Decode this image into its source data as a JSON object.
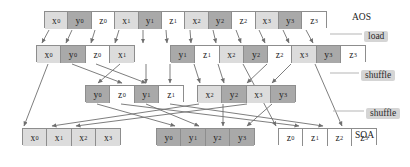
{
  "diagram": {
    "title_left": "AOS",
    "title_bottom": "SOA",
    "rows": [
      {
        "name": "aos-row",
        "y": 11,
        "x": 44,
        "cell_w": 23.4,
        "cell_h": 17,
        "groups": [
          {
            "x": 0,
            "cells": [
              {
                "label": "x",
                "sub": "0",
                "kind": "x"
              },
              {
                "label": "y",
                "sub": "0",
                "kind": "y"
              },
              {
                "label": "z",
                "sub": "0",
                "kind": "z"
              },
              {
                "label": "x",
                "sub": "1",
                "kind": "x"
              },
              {
                "label": "y",
                "sub": "1",
                "kind": "y"
              },
              {
                "label": "z",
                "sub": "1",
                "kind": "z"
              },
              {
                "label": "x",
                "sub": "2",
                "kind": "x"
              },
              {
                "label": "y",
                "sub": "2",
                "kind": "y"
              },
              {
                "label": "z",
                "sub": "2",
                "kind": "z"
              },
              {
                "label": "x",
                "sub": "3",
                "kind": "x"
              },
              {
                "label": "y",
                "sub": "3",
                "kind": "y"
              },
              {
                "label": "z",
                "sub": "3",
                "kind": "z"
              }
            ]
          }
        ]
      },
      {
        "name": "register-row-1",
        "y": 45,
        "x": 36,
        "cell_w": 24.3,
        "cell_h": 17,
        "groups": [
          {
            "x": 0,
            "cells": [
              {
                "label": "x",
                "sub": "0",
                "kind": "x"
              },
              {
                "label": "y",
                "sub": "0",
                "kind": "y"
              },
              {
                "label": "z",
                "sub": "0",
                "kind": "z"
              },
              {
                "label": "x",
                "sub": "1",
                "kind": "x"
              }
            ]
          },
          {
            "x": 134,
            "cells": [
              {
                "label": "y",
                "sub": "1",
                "kind": "y"
              },
              {
                "label": "z",
                "sub": "1",
                "kind": "z"
              },
              {
                "label": "x",
                "sub": "2",
                "kind": "x"
              },
              {
                "label": "y",
                "sub": "2",
                "kind": "y"
              }
            ]
          },
          {
            "x": 231,
            "cells": [
              {
                "label": "z",
                "sub": "2",
                "kind": "z"
              },
              {
                "label": "x",
                "sub": "3",
                "kind": "x"
              },
              {
                "label": "y",
                "sub": "3",
                "kind": "y"
              },
              {
                "label": "z",
                "sub": "3",
                "kind": "z"
              }
            ]
          }
        ]
      },
      {
        "name": "register-row-2",
        "y": 85,
        "x": 85,
        "cell_w": 24.3,
        "cell_h": 17,
        "groups": [
          {
            "x": 0,
            "cells": [
              {
                "label": "y",
                "sub": "0",
                "kind": "y"
              },
              {
                "label": "z",
                "sub": "0",
                "kind": "z"
              },
              {
                "label": "y",
                "sub": "1",
                "kind": "y"
              },
              {
                "label": "z",
                "sub": "1",
                "kind": "z"
              }
            ]
          },
          {
            "x": 112,
            "cells": [
              {
                "label": "x",
                "sub": "2",
                "kind": "x"
              },
              {
                "label": "y",
                "sub": "2",
                "kind": "y"
              },
              {
                "label": "x",
                "sub": "3",
                "kind": "x"
              },
              {
                "label": "y",
                "sub": "3",
                "kind": "y"
              }
            ]
          }
        ]
      },
      {
        "name": "soa-row",
        "y": 128,
        "x": 22,
        "cell_w": 24.3,
        "cell_h": 17,
        "groups": [
          {
            "x": 0,
            "cells": [
              {
                "label": "x",
                "sub": "0",
                "kind": "x"
              },
              {
                "label": "x",
                "sub": "1",
                "kind": "x"
              },
              {
                "label": "x",
                "sub": "2",
                "kind": "x"
              },
              {
                "label": "x",
                "sub": "3",
                "kind": "x"
              }
            ]
          },
          {
            "x": 134,
            "cells": [
              {
                "label": "y",
                "sub": "0",
                "kind": "y"
              },
              {
                "label": "y",
                "sub": "1",
                "kind": "y"
              },
              {
                "label": "y",
                "sub": "2",
                "kind": "y"
              },
              {
                "label": "y",
                "sub": "3",
                "kind": "y"
              }
            ]
          },
          {
            "x": 256,
            "cells": [
              {
                "label": "z",
                "sub": "0",
                "kind": "z"
              },
              {
                "label": "z",
                "sub": "1",
                "kind": "z"
              },
              {
                "label": "z",
                "sub": "2",
                "kind": "z"
              },
              {
                "label": "z",
                "sub": "3",
                "kind": "z"
              }
            ]
          }
        ]
      }
    ],
    "annotations": [
      {
        "name": "aos-label",
        "text": "AOS",
        "x": 352,
        "y": 12,
        "style": "plain"
      },
      {
        "name": "load-label",
        "text": "load",
        "x": 364,
        "y": 31,
        "style": "pill"
      },
      {
        "name": "shuffle-label-1",
        "text": "shuffle",
        "x": 361,
        "y": 70,
        "style": "pill"
      },
      {
        "name": "shuffle-label-2",
        "text": "shuffle",
        "x": 366,
        "y": 108,
        "style": "pill"
      },
      {
        "name": "soa-label",
        "text": "SOA",
        "x": 355,
        "y": 130,
        "style": "plain"
      }
    ],
    "colors": {
      "x_fill": "#dcdcdc",
      "y_fill": "#a9a9a9",
      "z_fill": "#ffffff",
      "border": "#8d8d8d",
      "arrow": "#6f6f6f",
      "pill_bg": "#d5d5d5",
      "text": "#1c1c1c"
    },
    "arrows": {
      "load": [
        {
          "x1": 49,
          "y1": 30,
          "x2": 42,
          "y2": 43
        },
        {
          "x1": 72,
          "y1": 30,
          "x2": 66,
          "y2": 43
        },
        {
          "x1": 95,
          "y1": 30,
          "x2": 91,
          "y2": 43
        },
        {
          "x1": 119,
          "y1": 30,
          "x2": 115,
          "y2": 43
        },
        {
          "x1": 143,
          "y1": 30,
          "x2": 143,
          "y2": 43
        },
        {
          "x1": 166,
          "y1": 30,
          "x2": 167,
          "y2": 43
        },
        {
          "x1": 190,
          "y1": 30,
          "x2": 191,
          "y2": 43
        },
        {
          "x1": 213,
          "y1": 30,
          "x2": 216,
          "y2": 43
        },
        {
          "x1": 236,
          "y1": 30,
          "x2": 241,
          "y2": 43
        },
        {
          "x1": 259,
          "y1": 30,
          "x2": 265,
          "y2": 43
        },
        {
          "x1": 283,
          "y1": 30,
          "x2": 289,
          "y2": 43
        },
        {
          "x1": 306,
          "y1": 30,
          "x2": 313,
          "y2": 43
        }
      ],
      "shuffle1": [
        {
          "x1": 48,
          "y1": 64,
          "x2": 24,
          "y2": 126
        },
        {
          "x1": 72,
          "y1": 64,
          "x2": 122,
          "y2": 83
        },
        {
          "x1": 96,
          "y1": 64,
          "x2": 146,
          "y2": 83
        },
        {
          "x1": 120,
          "y1": 64,
          "x2": 98,
          "y2": 83
        },
        {
          "x1": 146,
          "y1": 64,
          "x2": 146,
          "y2": 83
        },
        {
          "x1": 170,
          "y1": 64,
          "x2": 170,
          "y2": 83
        },
        {
          "x1": 194,
          "y1": 64,
          "x2": 200,
          "y2": 83
        },
        {
          "x1": 218,
          "y1": 64,
          "x2": 224,
          "y2": 83
        },
        {
          "x1": 243,
          "y1": 64,
          "x2": 276,
          "y2": 126
        },
        {
          "x1": 267,
          "y1": 64,
          "x2": 247,
          "y2": 83
        },
        {
          "x1": 291,
          "y1": 64,
          "x2": 272,
          "y2": 83
        },
        {
          "x1": 315,
          "y1": 64,
          "x2": 342,
          "y2": 126
        }
      ],
      "shuffle2": [
        {
          "x1": 97,
          "y1": 104,
          "x2": 175,
          "y2": 126
        },
        {
          "x1": 121,
          "y1": 104,
          "x2": 299,
          "y2": 126
        },
        {
          "x1": 146,
          "y1": 104,
          "x2": 199,
          "y2": 126
        },
        {
          "x1": 170,
          "y1": 104,
          "x2": 323,
          "y2": 126
        },
        {
          "x1": 199,
          "y1": 104,
          "x2": 52,
          "y2": 126
        },
        {
          "x1": 223,
          "y1": 104,
          "x2": 223,
          "y2": 126
        },
        {
          "x1": 247,
          "y1": 104,
          "x2": 76,
          "y2": 126
        },
        {
          "x1": 272,
          "y1": 104,
          "x2": 247,
          "y2": 126
        }
      ]
    }
  }
}
